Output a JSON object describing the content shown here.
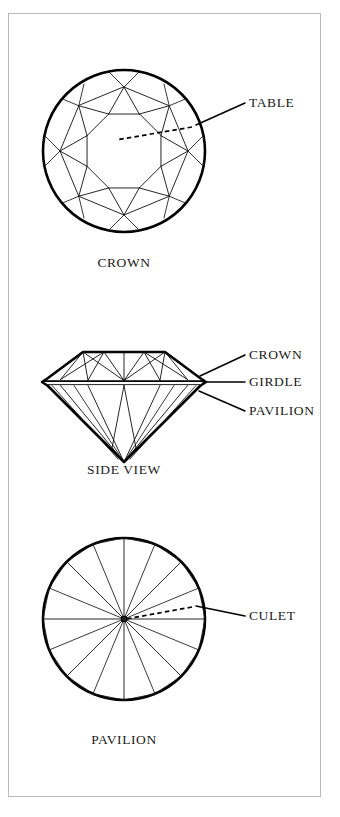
{
  "figure": {
    "border_color": "#b9b9b9",
    "line_color": "#000000",
    "background": "#ffffff"
  },
  "views": [
    {
      "id": "crown",
      "caption": "CROWN",
      "caption_x": 124,
      "caption_y": 267,
      "center_x": 124,
      "center_y": 151,
      "radius": 81
    },
    {
      "id": "side",
      "caption": "SIDE VIEW",
      "caption_x": 124,
      "caption_y": 474,
      "center_x": 124,
      "center_y": 400,
      "radius": 81
    },
    {
      "id": "pavilion",
      "caption": "PAVILION",
      "caption_x": 124,
      "caption_y": 744,
      "center_x": 124,
      "center_y": 619,
      "radius": 81
    }
  ],
  "callouts": [
    {
      "id": "table",
      "label": "TABLE",
      "text_x": 249,
      "text_y": 107,
      "leader_from_x": 245,
      "leader_from_y": 103,
      "leader_to_x": 196,
      "leader_to_y": 125,
      "dashed_from_x": 192,
      "dashed_from_y": 127,
      "dashed_to_x": 116,
      "dashed_to_y": 140
    },
    {
      "id": "crown",
      "label": "CROWN",
      "text_x": 249,
      "text_y": 359,
      "leader_from_x": 245,
      "leader_from_y": 355,
      "leader_to_x": 200,
      "leader_to_y": 376
    },
    {
      "id": "girdle",
      "label": "GIRDLE",
      "text_x": 249,
      "text_y": 386,
      "leader_from_x": 245,
      "leader_from_y": 382,
      "leader_to_x": 203,
      "leader_to_y": 382
    },
    {
      "id": "pavilion",
      "label": "PAVILION",
      "text_x": 249,
      "text_y": 415,
      "leader_from_x": 245,
      "leader_from_y": 411,
      "leader_to_x": 199,
      "leader_to_y": 391
    },
    {
      "id": "culet",
      "label": "CULET",
      "text_x": 249,
      "text_y": 620,
      "leader_from_x": 245,
      "leader_from_y": 616,
      "leader_to_x": 196,
      "leader_to_y": 606,
      "dashed_from_x": 192,
      "dashed_from_y": 607,
      "dashed_to_x": 126,
      "dashed_to_y": 619
    }
  ],
  "facet_counts": {
    "crown_star_facets": 8,
    "crown_bezel_facets": 8,
    "crown_upper_girdle_facets": 16,
    "pavilion_main_facets": 8,
    "pavilion_lower_girdle_facets": 16,
    "table_sides": 8
  }
}
